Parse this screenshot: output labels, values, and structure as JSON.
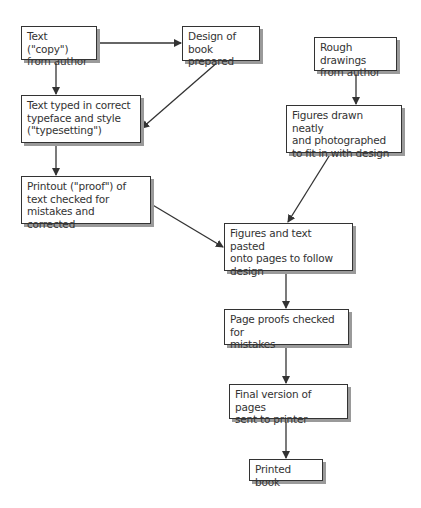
{
  "diagram": {
    "nodes": [
      {
        "id": "n1",
        "lines": [
          "Text (\"copy\")",
          "from author"
        ],
        "x": 21,
        "y": 26,
        "w": 76,
        "h": 34
      },
      {
        "id": "n2",
        "lines": [
          "Design of",
          "book prepared"
        ],
        "x": 182,
        "y": 26,
        "w": 78,
        "h": 35
      },
      {
        "id": "n3",
        "lines": [
          "Rough drawings",
          "from author"
        ],
        "x": 314,
        "y": 37,
        "w": 83,
        "h": 34
      },
      {
        "id": "n4",
        "lines": [
          "Figures drawn neatly",
          "and photographed",
          "to fit in with design"
        ],
        "x": 286,
        "y": 105,
        "w": 116,
        "h": 48
      },
      {
        "id": "n5",
        "lines": [
          "Text typed in correct",
          "typeface and style",
          "(\"typesetting\")"
        ],
        "x": 21,
        "y": 95,
        "w": 120,
        "h": 48
      },
      {
        "id": "n6",
        "lines": [
          "Printout (\"proof\") of",
          "text checked for",
          "mistakes and corrected"
        ],
        "x": 21,
        "y": 176,
        "w": 130,
        "h": 48
      },
      {
        "id": "n7",
        "lines": [
          "Figures and text pasted",
          "onto pages to follow",
          "design"
        ],
        "x": 224,
        "y": 223,
        "w": 129,
        "h": 48
      },
      {
        "id": "n8",
        "lines": [
          "Page proofs checked for",
          "mistakes"
        ],
        "x": 224,
        "y": 309,
        "w": 125,
        "h": 36
      },
      {
        "id": "n9",
        "lines": [
          "Final version of pages",
          "sent to printer"
        ],
        "x": 229,
        "y": 384,
        "w": 119,
        "h": 35
      },
      {
        "id": "n10",
        "lines": [
          "Printed book"
        ],
        "x": 249,
        "y": 459,
        "w": 74,
        "h": 22
      }
    ],
    "edges": [
      {
        "from": "n1",
        "to": "n2",
        "x1": 97,
        "y1": 43,
        "x2": 181,
        "y2": 43
      },
      {
        "from": "n1",
        "to": "n5",
        "x1": 56,
        "y1": 60,
        "x2": 56,
        "y2": 94
      },
      {
        "from": "n2",
        "to": "n5",
        "x1": 219,
        "y1": 61,
        "x2": 142,
        "y2": 128
      },
      {
        "from": "n3",
        "to": "n4",
        "x1": 356,
        "y1": 71,
        "x2": 356,
        "y2": 104
      },
      {
        "from": "n5",
        "to": "n6",
        "x1": 56,
        "y1": 143,
        "x2": 56,
        "y2": 175
      },
      {
        "from": "n6",
        "to": "n7",
        "x1": 151,
        "y1": 204,
        "x2": 223,
        "y2": 247
      },
      {
        "from": "n4",
        "to": "n7",
        "x1": 331,
        "y1": 153,
        "x2": 288,
        "y2": 222
      },
      {
        "from": "n7",
        "to": "n8",
        "x1": 286,
        "y1": 271,
        "x2": 286,
        "y2": 308
      },
      {
        "from": "n8",
        "to": "n9",
        "x1": 286,
        "y1": 345,
        "x2": 286,
        "y2": 383
      },
      {
        "from": "n9",
        "to": "n10",
        "x1": 286,
        "y1": 419,
        "x2": 286,
        "y2": 458
      }
    ],
    "colors": {
      "line": "#333333",
      "shadow": "#9a9a9a",
      "background": "#ffffff"
    }
  }
}
